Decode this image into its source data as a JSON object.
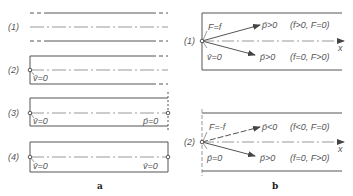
{
  "panel_a": {
    "caption": "a",
    "cases": [
      {
        "label": "(1)",
        "left": "",
        "right": ""
      },
      {
        "label": "(2)",
        "left": "v̄=0",
        "right": ""
      },
      {
        "label": "(3)",
        "left": "v̄=0",
        "right": "p̄=0"
      },
      {
        "label": "(4)",
        "left": "v̄=0",
        "right": "v̄=0"
      }
    ]
  },
  "panel_b": {
    "caption": "b",
    "axis_label": "x",
    "cases": [
      {
        "label": "(1)",
        "upper_left": "F=f",
        "lower_left": "v̄=0",
        "upper_ray": "p̄>0",
        "upper_cond": "(f>0, F=0)",
        "lower_ray": "p̄>0",
        "lower_cond": "(f=0, F>0)"
      },
      {
        "label": "(2)",
        "upper_left": "F=-f",
        "lower_left": "p̄=0",
        "upper_ray": "p̄<0",
        "upper_cond": "(f<0, F=0)",
        "lower_ray": "p̄>0",
        "lower_cond": "(f=0, F>0)"
      }
    ]
  }
}
